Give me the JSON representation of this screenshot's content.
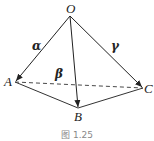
{
  "figure": {
    "caption": "图 1.25",
    "points": {
      "O": {
        "label": "O",
        "x": 70,
        "y": 16
      },
      "A": {
        "label": "A",
        "x": 15,
        "y": 82
      },
      "B": {
        "label": "B",
        "x": 78,
        "y": 108
      },
      "C": {
        "label": "C",
        "x": 143,
        "y": 88
      }
    },
    "vectors": [
      {
        "from": "O",
        "to": "A",
        "label": "α"
      },
      {
        "from": "O",
        "to": "B",
        "label": "β"
      },
      {
        "from": "O",
        "to": "C",
        "label": "γ"
      }
    ],
    "edges": [
      {
        "from": "A",
        "to": "B",
        "style": "solid"
      },
      {
        "from": "B",
        "to": "C",
        "style": "solid"
      },
      {
        "from": "A",
        "to": "C",
        "style": "dashed"
      }
    ]
  }
}
